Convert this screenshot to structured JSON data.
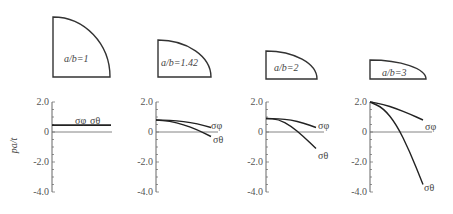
{
  "figure": {
    "y_axis_label": "pa/t",
    "sigma_phi": "σφ",
    "sigma_theta": "σθ",
    "panels": [
      {
        "ratio_label": "a/b=1"
      },
      {
        "ratio_label": "a/b=1.42"
      },
      {
        "ratio_label": "a/b=2"
      },
      {
        "ratio_label": "a/b=3"
      }
    ]
  },
  "chart_data": {
    "type": "line",
    "title": "",
    "ylabel": "pa/t",
    "xlabel": "",
    "ylim": [
      -4.0,
      2.0
    ],
    "yticks": [
      "2.0",
      "0",
      "-2.0",
      "-4.0"
    ],
    "grid": false,
    "legend": "inline labels at curve ends",
    "panels": [
      {
        "label": "a/b=1",
        "x": [
          0,
          0.25,
          0.5,
          0.75,
          1.0
        ],
        "series": [
          {
            "name": "σφ",
            "values": [
              0.45,
              0.45,
              0.45,
              0.45,
              0.45
            ]
          },
          {
            "name": "σθ",
            "values": [
              0.45,
              0.45,
              0.45,
              0.45,
              0.45
            ]
          }
        ]
      },
      {
        "label": "a/b=1.42",
        "x": [
          0,
          0.25,
          0.5,
          0.75,
          1.0
        ],
        "series": [
          {
            "name": "σφ",
            "values": [
              0.8,
              0.78,
              0.7,
              0.55,
              0.3
            ]
          },
          {
            "name": "σθ",
            "values": [
              0.8,
              0.72,
              0.5,
              0.15,
              -0.3
            ]
          }
        ]
      },
      {
        "label": "a/b=2",
        "x": [
          0,
          0.25,
          0.5,
          0.75,
          1.0
        ],
        "series": [
          {
            "name": "σφ",
            "values": [
              0.9,
              0.88,
              0.8,
              0.6,
              0.3
            ]
          },
          {
            "name": "σθ",
            "values": [
              0.9,
              0.85,
              0.4,
              -0.3,
              -1.1
            ]
          }
        ]
      },
      {
        "label": "a/b=3",
        "x": [
          0,
          0.25,
          0.5,
          0.75,
          1.0
        ],
        "series": [
          {
            "name": "σφ",
            "values": [
              2.0,
              1.85,
              1.55,
              1.2,
              0.8
            ]
          },
          {
            "name": "σθ",
            "values": [
              2.0,
              1.6,
              0.5,
              -1.3,
              -3.5
            ]
          }
        ]
      }
    ]
  }
}
